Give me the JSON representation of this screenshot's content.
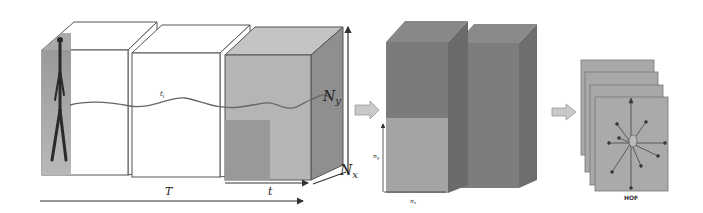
{
  "diagram": {
    "stage1": {
      "description": "Video volume split into temporal cells along time axis",
      "trajectory_label": "t_i",
      "time_total_label": "T",
      "time_cell_label": "t",
      "height_label": "N_y",
      "width_label": "N_x",
      "ny_main": "N",
      "ny_sub": "y",
      "nx_main": "N",
      "nx_sub": "x"
    },
    "stage2": {
      "description": "Grid of spatio-temporal cells",
      "cell_height_label": "n_y",
      "cell_width_label": "n_x",
      "ny_main": "n",
      "ny_sub": "y",
      "nx_main": "n",
      "nx_sub": "x"
    },
    "stage3": {
      "description": "Stack of histograms of optical flow",
      "label": "HOF",
      "frames": 4
    },
    "colors": {
      "cube_outline": "#555555",
      "cube_gray_front": "#b5b5b5",
      "cube_gray_top": "#c4c4c4",
      "cube_gray_side": "#8f8f8f",
      "cell_dark": "#7d7d7d",
      "cell_light": "#a4a4a4",
      "hof_panel": "#a8a8a8",
      "arrow_fill": "#c9c9c9"
    }
  }
}
